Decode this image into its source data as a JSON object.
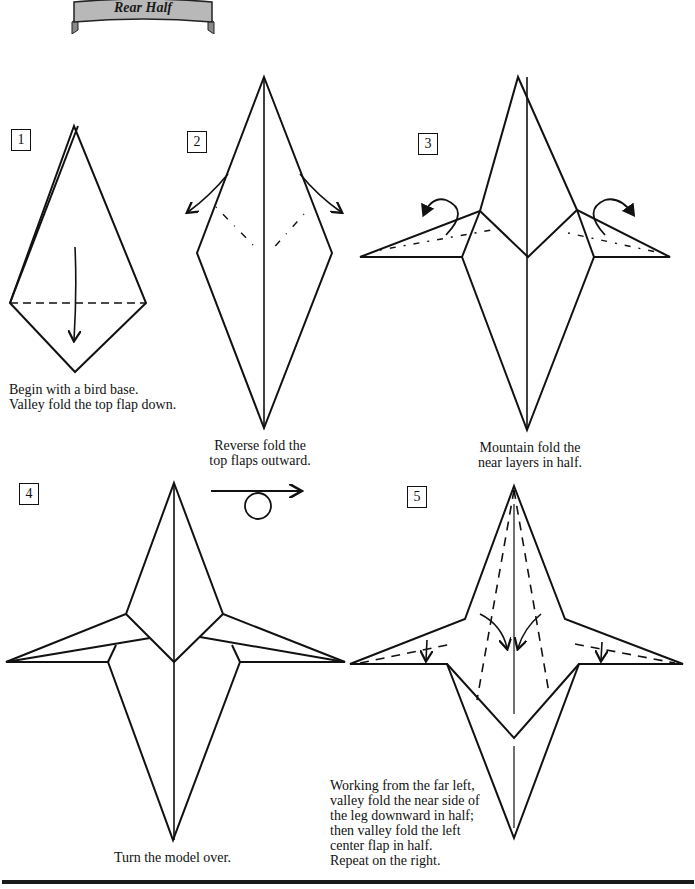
{
  "banner": {
    "title": "Rear Half"
  },
  "steps": [
    {
      "number": "1",
      "caption": "Begin with a bird base.\nValley fold the top flap down."
    },
    {
      "number": "2",
      "caption": "Reverse fold the\ntop flaps outward."
    },
    {
      "number": "3",
      "caption": "Mountain fold the\nnear layers in half."
    },
    {
      "number": "4",
      "caption": "Turn the model over."
    },
    {
      "number": "5",
      "caption": "Working from the far left,\nvalley fold the near side of\nthe leg downward in half;\nthen valley fold the left\ncenter flap in half.\nRepeat on the right."
    }
  ],
  "symbols": {
    "turn_over": "turn-over-arrow"
  },
  "colors": {
    "line": "#111111",
    "banner_fill": "#b8b8b8",
    "banner_stroke": "#222222",
    "rule": "#1a1a1a"
  }
}
